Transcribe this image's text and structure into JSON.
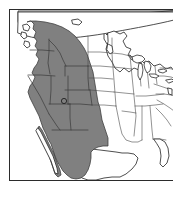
{
  "figure": {
    "type": "range-distribution-map",
    "region": "North America",
    "projection_hint": "conic",
    "frame": {
      "border_color": "#2b2b2b",
      "background": "#ffffff"
    },
    "background_color": "#ffffff"
  },
  "legend": {
    "shaded_label": "shaded range",
    "shade_color": "#808080",
    "outline_color": "#2f2f2f",
    "unshaded_color": "#ffffff"
  },
  "map": {
    "title": "",
    "caption": "",
    "landmass_label": "North America",
    "countries": [
      {
        "name": "Canada",
        "shaded": false
      },
      {
        "name": "United States",
        "shaded": "partial"
      },
      {
        "name": "Mexico",
        "shaded": "partial"
      }
    ],
    "shaded_regions": [
      {
        "name": "Washington",
        "coverage": "full"
      },
      {
        "name": "Oregon",
        "coverage": "full"
      },
      {
        "name": "Idaho",
        "coverage": "full"
      },
      {
        "name": "Montana",
        "coverage": "western"
      },
      {
        "name": "Wyoming",
        "coverage": "western"
      },
      {
        "name": "Nevada",
        "coverage": "full"
      },
      {
        "name": "Utah",
        "coverage": "full"
      },
      {
        "name": "California",
        "coverage": "eastern"
      },
      {
        "name": "Colorado",
        "coverage": "western"
      },
      {
        "name": "Arizona",
        "coverage": "full"
      },
      {
        "name": "New Mexico",
        "coverage": "full"
      },
      {
        "name": "Baja California",
        "coverage": "northern"
      },
      {
        "name": "Sonora",
        "coverage": "northern"
      },
      {
        "name": "Chihuahua",
        "coverage": "northwestern"
      }
    ],
    "unshaded_regions": [
      "Great Plains",
      "Midwest",
      "Northeast",
      "Southeast",
      "Texas",
      "Canada"
    ],
    "markers": [
      {
        "name": "locality-marker",
        "region": "Utah",
        "shape": "circle"
      }
    ],
    "water_features": [
      "Great Lakes",
      "Gulf of Mexico",
      "Pacific Ocean",
      "Atlantic Ocean"
    ]
  }
}
